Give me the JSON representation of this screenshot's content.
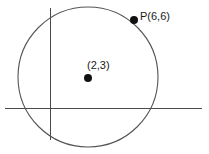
{
  "figure": {
    "type": "geometry-diagram",
    "background_color": "#ffffff",
    "width": 209,
    "height": 154
  },
  "axes": {
    "stroke_color": "#4a4a4a",
    "stroke_width": 1,
    "x_axis": {
      "name": "x-axis",
      "x1": 5,
      "y1": 108,
      "x2": 202,
      "y2": 108
    },
    "y_axis": {
      "name": "y-axis",
      "x1": 50,
      "y1": 8,
      "x2": 50,
      "y2": 140
    },
    "origin": {
      "x": 50,
      "y": 108
    }
  },
  "circle": {
    "stroke_color": "#555555",
    "stroke_width": 1.1,
    "fill": "none",
    "cx": 88,
    "cy": 77,
    "r": 70
  },
  "points": [
    {
      "id": "center",
      "label": "(2,3)",
      "marker_color": "#111111",
      "marker_radius": 4,
      "cx": 88,
      "cy": 78,
      "coordinates": {
        "x": 2,
        "y": 3
      }
    },
    {
      "id": "p",
      "label": "P(6,6)",
      "marker_color": "#111111",
      "marker_radius": 4,
      "cx": 134,
      "cy": 20,
      "coordinates": {
        "x": 6,
        "y": 6
      }
    }
  ],
  "labels": {
    "center_label": "(2,3)",
    "point_p_label": "P(6,6)"
  }
}
